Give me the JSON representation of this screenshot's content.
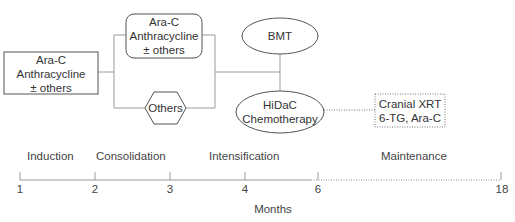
{
  "diagram": {
    "nodes": {
      "induction": {
        "shape": "rectangle",
        "lines": [
          "Ara-C",
          "Anthracycline",
          "± others"
        ]
      },
      "consolidation_std": {
        "shape": "rounded-rectangle",
        "lines": [
          "Ara-C",
          "Anthracycline",
          "± others"
        ]
      },
      "consolidation_others": {
        "shape": "hexagon",
        "lines": [
          "Others"
        ]
      },
      "bmt": {
        "shape": "ellipse",
        "lines": [
          "BMT"
        ]
      },
      "hidac": {
        "shape": "ellipse",
        "lines": [
          "HiDaC",
          "Chemotherapy"
        ]
      },
      "maintenance": {
        "shape": "dotted-rectangle",
        "lines": [
          "Cranial XRT",
          "6-TG, Ara-C"
        ]
      }
    },
    "edges": [
      {
        "from": "induction",
        "to": "consolidation_std",
        "style": "solid"
      },
      {
        "from": "induction",
        "to": "consolidation_others",
        "style": "solid"
      },
      {
        "from": "consolidation_std",
        "to": "bmt/hidac",
        "style": "solid"
      },
      {
        "from": "consolidation_others",
        "to": "bmt/hidac",
        "style": "solid"
      },
      {
        "from": "hidac",
        "to": "maintenance",
        "style": "dotted"
      }
    ]
  },
  "timeline": {
    "phases": [
      "Induction",
      "Consolidation",
      "Intensification",
      "Maintenance"
    ],
    "ticks": [
      "1",
      "2",
      "3",
      "4",
      "6",
      "18"
    ],
    "axis_title": "Months"
  },
  "colors": {
    "line": "#9a9a9a",
    "text": "#333333",
    "box_border": "#555555"
  }
}
